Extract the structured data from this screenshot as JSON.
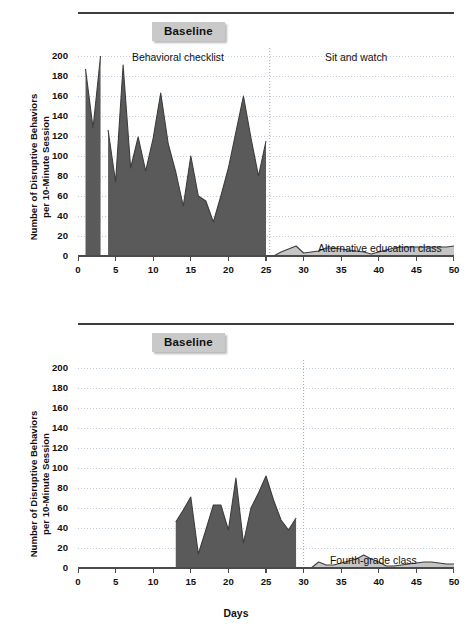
{
  "figure": {
    "xaxis_title": "Days",
    "yaxis_title_line1": "Number of Disruptive Behaviors",
    "yaxis_title_line2": "per 10-Minute Session",
    "baseline_badge": "Baseline",
    "colors": {
      "baseline_fill": "#5a5a5a",
      "intervention_fill": "#c5c5c5",
      "line_stroke": "#3d3d3d",
      "grid": "#b9c6d6",
      "axis": "#4a4a4a",
      "badge_bg": "#c9c9c9",
      "rule": "#3d3d3d"
    },
    "y_ticks": [
      0,
      20,
      40,
      60,
      80,
      100,
      120,
      140,
      160,
      180,
      200
    ],
    "x_ticks": [
      0,
      5,
      10,
      15,
      20,
      25,
      30,
      35,
      40,
      45,
      50
    ]
  },
  "chart_data": [
    {
      "id": "top",
      "type": "area",
      "title": "",
      "xlabel": "Days",
      "ylabel": "Number of Disruptive Behaviors per 10-Minute Session",
      "xlim": [
        0,
        50
      ],
      "ylim": [
        0,
        210
      ],
      "grid": true,
      "phase_change_day": 25.5,
      "annotations": [
        {
          "text": "Baseline",
          "kind": "badge"
        },
        {
          "text": "Behavioral checklist",
          "kind": "phase-label"
        },
        {
          "text": "Sit and watch",
          "kind": "phase-label"
        },
        {
          "text": "Alternative education class",
          "kind": "series-label"
        }
      ],
      "series": [
        {
          "name": "Behavioral checklist",
          "phase": "baseline",
          "fill": "#5a5a5a",
          "segments": [
            {
              "x": [
                1,
                2,
                3
              ],
              "y": [
                187,
                128,
                200
              ]
            },
            {
              "x": [
                4,
                5,
                6,
                7,
                8,
                9,
                10,
                11,
                12,
                13,
                14,
                15,
                16,
                17,
                18,
                19,
                20,
                21,
                22,
                23,
                24,
                25
              ],
              "y": [
                126,
                74,
                191,
                88,
                119,
                85,
                118,
                163,
                112,
                84,
                50,
                100,
                60,
                55,
                34,
                60,
                88,
                124,
                160,
                118,
                80,
                115
              ]
            }
          ]
        },
        {
          "name": "Alternative education class",
          "phase": "intervention",
          "fill": "#c5c5c5",
          "segments": [
            {
              "x": [
                26,
                27,
                28,
                29,
                30,
                31,
                32,
                33,
                34,
                35,
                36,
                37,
                38,
                39,
                40,
                41,
                42,
                43,
                44,
                45,
                46,
                47,
                48,
                49,
                50
              ],
              "y": [
                0,
                4,
                7,
                10,
                3,
                4,
                5,
                8,
                8,
                7,
                6,
                5,
                4,
                2,
                4,
                6,
                8,
                9,
                9,
                9,
                9,
                9,
                9,
                9,
                10
              ]
            }
          ]
        }
      ]
    },
    {
      "id": "bottom",
      "type": "area",
      "title": "",
      "xlabel": "Days",
      "ylabel": "Number of Disruptive Behaviors per 10-Minute Session",
      "xlim": [
        0,
        50
      ],
      "ylim": [
        0,
        210
      ],
      "grid": true,
      "phase_change_day": 30,
      "annotations": [
        {
          "text": "Baseline",
          "kind": "badge"
        },
        {
          "text": "Fourth-grade class",
          "kind": "series-label"
        }
      ],
      "series": [
        {
          "name": "Baseline",
          "phase": "baseline",
          "fill": "#5a5a5a",
          "segments": [
            {
              "x": [
                13,
                14,
                15,
                16,
                17,
                18,
                19,
                20,
                21,
                22,
                23,
                24,
                25,
                26,
                27,
                28,
                29
              ],
              "y": [
                46,
                58,
                71,
                14,
                38,
                63,
                63,
                38,
                90,
                25,
                60,
                75,
                92,
                68,
                48,
                38,
                50
              ]
            }
          ]
        },
        {
          "name": "Fourth-grade class",
          "phase": "intervention",
          "fill": "#c5c5c5",
          "segments": [
            {
              "x": [
                31,
                32,
                33,
                34,
                35,
                36,
                37,
                38,
                39,
                40,
                41,
                42,
                43,
                44,
                45,
                46,
                47,
                48,
                49,
                50
              ],
              "y": [
                0,
                6,
                3,
                3,
                5,
                7,
                9,
                13,
                9,
                6,
                2,
                2,
                3,
                4,
                5,
                6,
                6,
                5,
                4,
                4
              ]
            }
          ]
        }
      ]
    }
  ],
  "panels": {
    "top": {
      "phase_label_left": "Behavioral checklist",
      "phase_label_right": "Sit and watch",
      "series_label": "Alternative education class"
    },
    "bottom": {
      "series_label": "Fourth-grade class"
    }
  }
}
